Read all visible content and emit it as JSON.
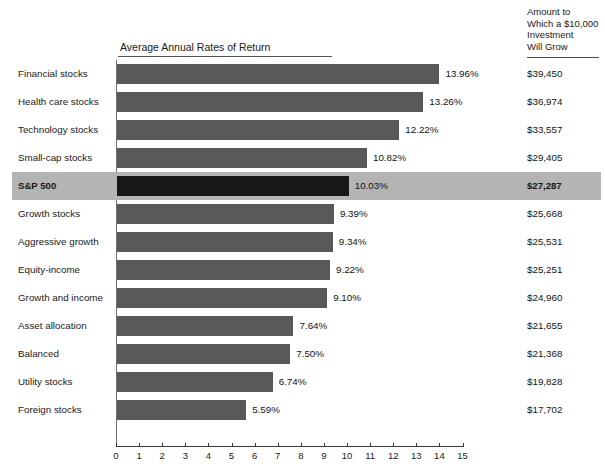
{
  "chart_title": "Average Annual Rates of Return",
  "amount_header": {
    "lines": [
      "Amount to",
      "Which a $10,000",
      "Investment",
      "Will Grow"
    ]
  },
  "highlight_category": "S&P 500",
  "colors": {
    "bar": "#595959",
    "bar_highlight": "#171717",
    "row_highlight_band": "#b4b4b4",
    "axis": "#3a3a3a",
    "text": "#1a1a1a",
    "page_background": "#ffffff"
  },
  "axis": {
    "ticks": [
      "0",
      "1",
      "2",
      "3",
      "4",
      "5",
      "6",
      "7",
      "8",
      "9",
      "10",
      "11",
      "12",
      "13",
      "14",
      "15"
    ],
    "min": 0,
    "max": 15
  },
  "chart_data": {
    "type": "bar",
    "orientation": "horizontal",
    "title": "Average Annual Rates of Return",
    "xlabel": "",
    "ylabel": "",
    "xlim": [
      0,
      15
    ],
    "grid": false,
    "legend": "none",
    "categories": [
      "Financial stocks",
      "Health care stocks",
      "Technology stocks",
      "Small-cap stocks",
      "S&P 500",
      "Growth stocks",
      "Aggressive growth",
      "Equity-income",
      "Growth and income",
      "Asset allocation",
      "Balanced",
      "Utility stocks",
      "Foreign stocks"
    ],
    "values": [
      13.96,
      13.26,
      12.22,
      10.82,
      10.03,
      9.39,
      9.34,
      9.22,
      9.1,
      7.64,
      7.5,
      6.74,
      5.59
    ],
    "value_labels": [
      "13.96%",
      "13.26%",
      "12.22%",
      "10.82%",
      "10.03%",
      "9.39%",
      "9.34%",
      "9.22%",
      "9.10%",
      "7.64%",
      "7.50%",
      "6.74%",
      "5.59%"
    ],
    "secondary_series": {
      "name": "Amount to Which a $10,000 Investment Will Grow",
      "labels": [
        "$39,450",
        "$36,974",
        "$33,557",
        "$29,405",
        "$27,287",
        "$25,668",
        "$25,531",
        "$25,251",
        "$24,960",
        "$21,655",
        "$21,368",
        "$19,828",
        "$17,702"
      ],
      "values": [
        39450,
        36974,
        33557,
        29405,
        27287,
        25668,
        25531,
        25251,
        24960,
        21655,
        21368,
        19828,
        17702
      ]
    }
  },
  "rows": [
    {
      "label": "Financial stocks",
      "value": 13.96,
      "value_label": "13.96%",
      "amount": "$39,450",
      "highlighted": false
    },
    {
      "label": "Health care stocks",
      "value": 13.26,
      "value_label": "13.26%",
      "amount": "$36,974",
      "highlighted": false
    },
    {
      "label": "Technology stocks",
      "value": 12.22,
      "value_label": "12.22%",
      "amount": "$33,557",
      "highlighted": false
    },
    {
      "label": "Small-cap stocks",
      "value": 10.82,
      "value_label": "10.82%",
      "amount": "$29,405",
      "highlighted": false
    },
    {
      "label": "S&P 500",
      "value": 10.03,
      "value_label": "10.03%",
      "amount": "$27,287",
      "highlighted": true
    },
    {
      "label": "Growth stocks",
      "value": 9.39,
      "value_label": "9.39%",
      "amount": "$25,668",
      "highlighted": false
    },
    {
      "label": "Aggressive growth",
      "value": 9.34,
      "value_label": "9.34%",
      "amount": "$25,531",
      "highlighted": false
    },
    {
      "label": "Equity-income",
      "value": 9.22,
      "value_label": "9.22%",
      "amount": "$25,251",
      "highlighted": false
    },
    {
      "label": "Growth and income",
      "value": 9.1,
      "value_label": "9.10%",
      "amount": "$24,960",
      "highlighted": false
    },
    {
      "label": "Asset allocation",
      "value": 7.64,
      "value_label": "7.64%",
      "amount": "$21,655",
      "highlighted": false
    },
    {
      "label": "Balanced",
      "value": 7.5,
      "value_label": "7.50%",
      "amount": "$21,368",
      "highlighted": false
    },
    {
      "label": "Utility stocks",
      "value": 6.74,
      "value_label": "6.74%",
      "amount": "$19,828",
      "highlighted": false
    },
    {
      "label": "Foreign stocks",
      "value": 5.59,
      "value_label": "5.59%",
      "amount": "$17,702",
      "highlighted": false
    }
  ]
}
